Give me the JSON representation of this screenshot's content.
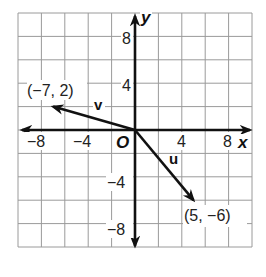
{
  "chart_data": {
    "type": "vector-plot",
    "title": "",
    "xlabel": "x",
    "ylabel": "y",
    "origin_label": "O",
    "xlim": [
      -10,
      10
    ],
    "ylim": [
      -10,
      10
    ],
    "grid": true,
    "grid_step": 2,
    "x_ticks": [
      {
        "value": -8,
        "label": "−8"
      },
      {
        "value": -4,
        "label": "−4"
      },
      {
        "value": 4,
        "label": "4"
      },
      {
        "value": 8,
        "label": "8"
      }
    ],
    "y_ticks": [
      {
        "value": 8,
        "label": "8"
      },
      {
        "value": 4,
        "label": "4"
      },
      {
        "value": -4,
        "label": "−4"
      },
      {
        "value": -8,
        "label": "−8"
      }
    ],
    "vectors": [
      {
        "name": "v",
        "from": [
          0,
          0
        ],
        "to": [
          -7,
          2
        ],
        "endpoint_label": "(−7, 2)"
      },
      {
        "name": "u",
        "from": [
          0,
          0
        ],
        "to": [
          5,
          -6
        ],
        "endpoint_label": "(5, −6)"
      }
    ]
  },
  "labels": {
    "x_axis": "x",
    "y_axis": "y",
    "origin": "O",
    "vector_v": "v",
    "vector_u": "u",
    "point_v": "(−7, 2)",
    "point_u": "(5, −6)",
    "xtick_m8": "−8",
    "xtick_m4": "−4",
    "xtick_4": "4",
    "xtick_8": "8",
    "ytick_8": "8",
    "ytick_4": "4",
    "ytick_m4": "−4",
    "ytick_m8": "−8"
  }
}
